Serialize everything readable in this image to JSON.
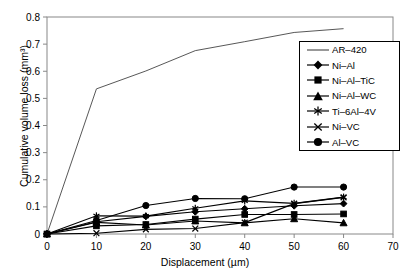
{
  "chart_data": {
    "type": "line",
    "title": "",
    "xlabel": "Displacement (µm)",
    "ylabel": "Cumulative volume loss (mm³)",
    "xlim": [
      0,
      70
    ],
    "ylim": [
      0,
      0.8
    ],
    "xticks": [
      0,
      10,
      20,
      30,
      40,
      50,
      60,
      70
    ],
    "xtick_labels": [
      "0",
      "10",
      "20",
      "30",
      "40",
      "50",
      "60",
      "70"
    ],
    "yticks": [
      0,
      0.1,
      0.2,
      0.3,
      0.4,
      0.5,
      0.6,
      0.7,
      0.8
    ],
    "ytick_labels": [
      "0",
      "0.1",
      "0.2",
      "0.3",
      "0.4",
      "0.5",
      "0.6",
      "0.7",
      "0.8"
    ],
    "grid": false,
    "legend_position": "upper right",
    "x": [
      0,
      10,
      20,
      30,
      40,
      50,
      60
    ],
    "series": [
      {
        "name": "AR–420",
        "marker": "none",
        "values": [
          0,
          0.535,
          0.601,
          0.676,
          0.709,
          0.743,
          0.757
        ]
      },
      {
        "name": "Ni–Al",
        "marker": "diamond",
        "values": [
          0,
          0.045,
          0.065,
          0.082,
          0.093,
          0.104,
          0.112
        ]
      },
      {
        "name": "Ni–Al–TiC",
        "marker": "square",
        "values": [
          0,
          0.03,
          0.035,
          0.055,
          0.072,
          0.072,
          0.074
        ]
      },
      {
        "name": "Ni–Al–WC",
        "marker": "triangle",
        "values": [
          0,
          0.043,
          0.033,
          0.048,
          0.041,
          0.056,
          0.041
        ]
      },
      {
        "name": "Ti–6Al–4V",
        "marker": "asterisk",
        "values": [
          0,
          0.067,
          0.066,
          0.095,
          0.122,
          0.113,
          0.136
        ]
      },
      {
        "name": "Ni–VC",
        "marker": "x",
        "values": [
          0,
          0.003,
          0.017,
          0.02,
          0.042,
          0.112,
          0.135
        ]
      },
      {
        "name": "Al–VC",
        "marker": "circle",
        "values": [
          0,
          0.05,
          0.105,
          0.131,
          0.13,
          0.173,
          0.173
        ]
      }
    ]
  },
  "axes": {
    "x_title": "Displacement (µm)",
    "y_title": "Cumulative volume loss (mm³)"
  },
  "legend": {
    "entries": [
      {
        "label": "AR–420"
      },
      {
        "label": "Ni–Al"
      },
      {
        "label": "Ni–Al–TiC"
      },
      {
        "label": "Ni–Al–WC"
      },
      {
        "label": "Ti–6Al–4V"
      },
      {
        "label": "Ni–VC"
      },
      {
        "label": "Al–VC"
      }
    ]
  }
}
